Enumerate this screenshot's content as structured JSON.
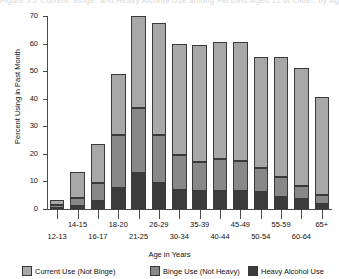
{
  "chart_data": {
    "type": "bar",
    "subtype": "stacked-bar",
    "title": "Figure 3.2 Current, Binge, and Heavy Alcohol Use among Persons Aged 12 or Older, by Age",
    "xlabel": "Age in Years",
    "ylabel": "Percent Using in Past Month",
    "ylim": [
      0,
      70
    ],
    "yticks": [
      0,
      10,
      20,
      30,
      40,
      50,
      60,
      70
    ],
    "ytick_labels": [
      "0",
      "10",
      "20",
      "30",
      "40",
      "50",
      "60",
      "70"
    ],
    "grid": false,
    "legend_position": "bottom",
    "categories": [
      "12-13",
      "14-15",
      "16-17",
      "18-20",
      "21-25",
      "26-29",
      "30-34",
      "35-39",
      "40-44",
      "45-49",
      "50-54",
      "55-59",
      "60-64",
      "65+"
    ],
    "series": [
      {
        "name": "Heavy Alcohol Use",
        "color": "#3c3c3c",
        "values": [
          0.5,
          1.0,
          3.0,
          7.5,
          13.0,
          9.5,
          7.0,
          6.5,
          6.5,
          6.5,
          6.0,
          4.5,
          3.5,
          1.8
        ]
      },
      {
        "name": "Binge Use (Not Heavy)",
        "color": "#888888",
        "values": [
          1.0,
          3.0,
          6.5,
          19.5,
          23.5,
          17.5,
          12.5,
          10.5,
          11.5,
          11.0,
          9.0,
          7.0,
          5.0,
          3.2
        ]
      },
      {
        "name": "Current Use (Not Binge)",
        "color": "#a8a8a8",
        "values": [
          1.8,
          9.5,
          14.0,
          22.0,
          33.5,
          40.5,
          40.5,
          42.5,
          42.5,
          43.0,
          40.0,
          43.5,
          42.5,
          35.5
        ]
      }
    ],
    "totals": [
      3.3,
      13.5,
      23.5,
      49.0,
      70.0,
      67.5,
      60.0,
      59.5,
      60.5,
      60.5,
      55.0,
      55.0,
      51.0,
      40.5
    ]
  },
  "axis": {
    "ylabel": "Percent Using in Past Month",
    "xlabel": "Age in Years"
  },
  "legend": {
    "items": [
      {
        "label": "Current Use (Not Binge)",
        "color": "#a8a8a8"
      },
      {
        "label": "Binge Use (Not Heavy)",
        "color": "#888888"
      },
      {
        "label": "Heavy Alcohol Use",
        "color": "#3c3c3c"
      }
    ]
  }
}
